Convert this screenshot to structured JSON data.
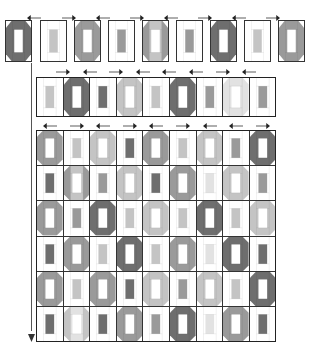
{
  "colors": {
    "D": "#6e6e6e",
    "M": "#9a9a9a",
    "L": "#c4c4c4",
    "X": "#e2e2e2",
    "W": "#ffffff",
    "line": "#333333"
  },
  "diagram": {
    "title": ""
  },
  "top_row": {
    "arrows": [
      "left",
      "right",
      "left",
      "right",
      "left",
      "right",
      "left",
      "right"
    ],
    "blocks": [
      {
        "outer": "D",
        "center": "W",
        "bars": "D"
      },
      {
        "outer": "W",
        "center": "L",
        "bars": "W"
      },
      {
        "outer": "M",
        "center": "W",
        "bars": "M"
      },
      {
        "outer": "W",
        "center": "M",
        "bars": "W"
      },
      {
        "outer": "M",
        "center": "W",
        "bars": "L"
      },
      {
        "outer": "W",
        "center": "M",
        "bars": "W"
      },
      {
        "outer": "D",
        "center": "W",
        "bars": "D"
      },
      {
        "outer": "W",
        "center": "L",
        "bars": "W"
      },
      {
        "outer": "M",
        "center": "W",
        "bars": "M"
      }
    ]
  },
  "strip_row": {
    "arrows": [
      "right",
      "left",
      "right",
      "left",
      "left",
      "left",
      "right",
      "left"
    ],
    "blocks": [
      {
        "outer": "W",
        "center": "L",
        "bars": "W"
      },
      {
        "outer": "D",
        "center": "W",
        "bars": "D"
      },
      {
        "outer": "W",
        "center": "D",
        "bars": "W"
      },
      {
        "outer": "L",
        "center": "W",
        "bars": "L"
      },
      {
        "outer": "W",
        "center": "L",
        "bars": "W"
      },
      {
        "outer": "D",
        "center": "W",
        "bars": "D"
      },
      {
        "outer": "W",
        "center": "M",
        "bars": "W"
      },
      {
        "outer": "X",
        "center": "W",
        "bars": "X"
      },
      {
        "outer": "W",
        "center": "M",
        "bars": "W"
      }
    ]
  },
  "quilt_top": {
    "cols": 9,
    "rows": 6,
    "arrows": [
      "left",
      "right",
      "left",
      "right",
      "left",
      "right",
      "left",
      "left",
      "right"
    ],
    "grid": [
      [
        {
          "outer": "M",
          "center": "W",
          "bars": "M"
        },
        {
          "outer": "W",
          "center": "L",
          "bars": "W"
        },
        {
          "outer": "L",
          "center": "W",
          "bars": "L"
        },
        {
          "outer": "W",
          "center": "D",
          "bars": "W"
        },
        {
          "outer": "M",
          "center": "W",
          "bars": "M"
        },
        {
          "outer": "W",
          "center": "L",
          "bars": "W"
        },
        {
          "outer": "L",
          "center": "W",
          "bars": "L"
        },
        {
          "outer": "W",
          "center": "M",
          "bars": "W"
        },
        {
          "outer": "D",
          "center": "W",
          "bars": "D"
        }
      ],
      [
        {
          "outer": "W",
          "center": "D",
          "bars": "W"
        },
        {
          "outer": "M",
          "center": "W",
          "bars": "L"
        },
        {
          "outer": "W",
          "center": "M",
          "bars": "W"
        },
        {
          "outer": "L",
          "center": "W",
          "bars": "L"
        },
        {
          "outer": "W",
          "center": "D",
          "bars": "W"
        },
        {
          "outer": "M",
          "center": "W",
          "bars": "M"
        },
        {
          "outer": "W",
          "center": "X",
          "bars": "W"
        },
        {
          "outer": "L",
          "center": "W",
          "bars": "L"
        },
        {
          "outer": "W",
          "center": "M",
          "bars": "W"
        }
      ],
      [
        {
          "outer": "M",
          "center": "W",
          "bars": "M"
        },
        {
          "outer": "W",
          "center": "M",
          "bars": "W"
        },
        {
          "outer": "D",
          "center": "W",
          "bars": "D"
        },
        {
          "outer": "W",
          "center": "L",
          "bars": "W"
        },
        {
          "outer": "L",
          "center": "W",
          "bars": "L"
        },
        {
          "outer": "W",
          "center": "L",
          "bars": "W"
        },
        {
          "outer": "D",
          "center": "W",
          "bars": "D"
        },
        {
          "outer": "W",
          "center": "L",
          "bars": "W"
        },
        {
          "outer": "L",
          "center": "W",
          "bars": "L"
        }
      ],
      [
        {
          "outer": "W",
          "center": "D",
          "bars": "W"
        },
        {
          "outer": "M",
          "center": "W",
          "bars": "M"
        },
        {
          "outer": "W",
          "center": "L",
          "bars": "W"
        },
        {
          "outer": "D",
          "center": "W",
          "bars": "D"
        },
        {
          "outer": "W",
          "center": "L",
          "bars": "W"
        },
        {
          "outer": "M",
          "center": "W",
          "bars": "M"
        },
        {
          "outer": "W",
          "center": "X",
          "bars": "W"
        },
        {
          "outer": "D",
          "center": "W",
          "bars": "D"
        },
        {
          "outer": "W",
          "center": "D",
          "bars": "W"
        }
      ],
      [
        {
          "outer": "M",
          "center": "W",
          "bars": "M"
        },
        {
          "outer": "W",
          "center": "L",
          "bars": "W"
        },
        {
          "outer": "M",
          "center": "W",
          "bars": "M"
        },
        {
          "outer": "W",
          "center": "D",
          "bars": "W"
        },
        {
          "outer": "L",
          "center": "W",
          "bars": "L"
        },
        {
          "outer": "W",
          "center": "M",
          "bars": "W"
        },
        {
          "outer": "L",
          "center": "W",
          "bars": "L"
        },
        {
          "outer": "W",
          "center": "L",
          "bars": "W"
        },
        {
          "outer": "D",
          "center": "W",
          "bars": "D"
        }
      ],
      [
        {
          "outer": "W",
          "center": "D",
          "bars": "W"
        },
        {
          "outer": "L",
          "center": "W",
          "bars": "X"
        },
        {
          "outer": "W",
          "center": "D",
          "bars": "W"
        },
        {
          "outer": "M",
          "center": "W",
          "bars": "M"
        },
        {
          "outer": "W",
          "center": "M",
          "bars": "W"
        },
        {
          "outer": "D",
          "center": "W",
          "bars": "D"
        },
        {
          "outer": "W",
          "center": "X",
          "bars": "W"
        },
        {
          "outer": "M",
          "center": "W",
          "bars": "M"
        },
        {
          "outer": "W",
          "center": "D",
          "bars": "W"
        }
      ]
    ]
  },
  "layout_arrow": {
    "direction": "down"
  }
}
